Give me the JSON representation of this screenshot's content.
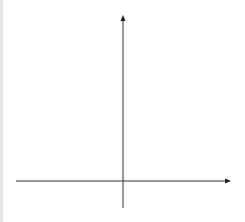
{
  "chart_data": {
    "type": "line",
    "title": "",
    "xlabel": "x",
    "ylabel": "y",
    "xlim": [
      -4,
      4
    ],
    "ylim": [
      -5,
      30
    ],
    "grid": true,
    "legend": "none (inline curve labels)",
    "x_ticks": [
      "-4",
      "-3",
      "-2",
      "-1",
      "0",
      "1",
      "2",
      "3",
      "4"
    ],
    "y_ticks": [
      "30",
      "25",
      "20",
      "15",
      "10",
      "5",
      "-5"
    ],
    "series": [
      {
        "name": "y = 3^-x",
        "label_base": "y = 3",
        "label_exp": "-x",
        "x": [
          -3,
          -2.5,
          -2,
          -1.5,
          -1,
          -0.5,
          0,
          0.5,
          1
        ],
        "values": [
          27,
          15.59,
          9,
          5.2,
          3,
          1.73,
          1,
          0.58,
          0.33
        ]
      },
      {
        "name": "y = 3^x",
        "label_base": "y = 3",
        "label_exp": "x",
        "x": [
          -1,
          -0.5,
          0,
          0.5,
          1,
          1.5,
          2,
          2.5,
          3
        ],
        "values": [
          0.33,
          0.58,
          1,
          1.73,
          3,
          5.2,
          9,
          15.59,
          27
        ]
      }
    ]
  },
  "colors": {
    "curve": "#555555",
    "axis": "#333333",
    "grid_minor": "#d6d6d6",
    "grid_major": "#a8a8a8"
  }
}
